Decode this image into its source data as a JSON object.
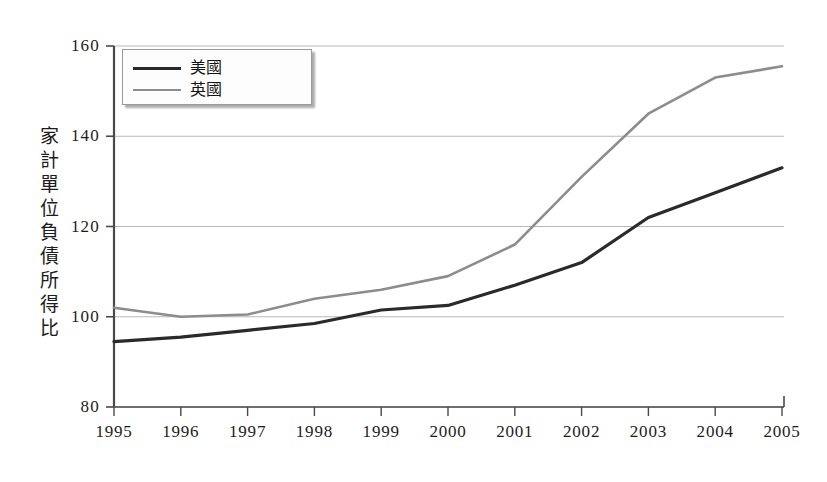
{
  "chart_data": {
    "type": "line",
    "title": "",
    "xlabel": "",
    "ylabel": "家計單位負債所得比",
    "x": [
      1995,
      1996,
      1997,
      1998,
      1999,
      2000,
      2001,
      2002,
      2003,
      2004,
      2005
    ],
    "xtick_labels": [
      "1995",
      "1996",
      "1997",
      "1998",
      "1999",
      "2000",
      "2001",
      "2002",
      "2003",
      "2004",
      "2005"
    ],
    "ytick_labels": [
      "80",
      "100",
      "120",
      "140",
      "160"
    ],
    "yticks": [
      80,
      100,
      120,
      140,
      160
    ],
    "ylim": [
      80,
      160
    ],
    "xlim": [
      1995,
      2005
    ],
    "grid": true,
    "legend_position": "upper-left-inside",
    "series": [
      {
        "name": "美國",
        "color": "#2a2a2a",
        "line_width": 3.2,
        "values": [
          94.5,
          95.5,
          97.0,
          98.5,
          101.5,
          102.5,
          107.0,
          112.0,
          122.0,
          127.5,
          133.0
        ]
      },
      {
        "name": "英國",
        "color": "#8c8c8c",
        "line_width": 2.6,
        "values": [
          102.0,
          100.0,
          100.5,
          104.0,
          106.0,
          109.0,
          116.0,
          131.0,
          145.0,
          153.0,
          155.5
        ]
      }
    ]
  },
  "legend": {
    "items": [
      {
        "label": "美國",
        "color": "#2a2a2a",
        "width": 3.2
      },
      {
        "label": "英國",
        "color": "#8c8c8c",
        "width": 2.6
      }
    ]
  },
  "axes": {
    "axis_color": "#4a4a4a",
    "grid_color": "#b9b9b9",
    "tick_color": "#4a4a4a"
  }
}
